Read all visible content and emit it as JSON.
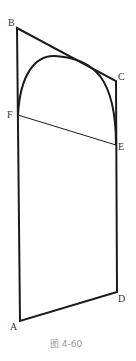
{
  "diagram": {
    "caption": "图 4-60",
    "points": {
      "A": {
        "label": "A",
        "x": 20,
        "y": 321
      },
      "B": {
        "label": "B",
        "x": 17,
        "y": 28
      },
      "C": {
        "label": "C",
        "x": 116,
        "y": 81
      },
      "D": {
        "label": "D",
        "x": 117,
        "y": 292
      },
      "E": {
        "label": "E",
        "x": 116,
        "y": 145
      },
      "F": {
        "label": "F",
        "x": 18,
        "y": 115
      }
    },
    "segments": [
      "AB",
      "BC",
      "CD",
      "DA",
      "FE"
    ],
    "arc": "F to E, tangent to BC",
    "colors": {
      "stroke": "#1a1a1a",
      "caption": "#999999"
    }
  }
}
